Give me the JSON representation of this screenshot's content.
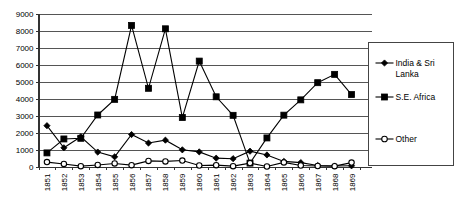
{
  "chart_data": {
    "type": "line",
    "title": "",
    "subtitle": "",
    "xlabel": "",
    "ylabel": "",
    "ylim": [
      0,
      9000
    ],
    "ytick_step": 1000,
    "yticks": [
      "0",
      "1000",
      "2000",
      "3000",
      "4000",
      "5000",
      "6000",
      "7000",
      "8000",
      "9000"
    ],
    "grid": true,
    "legend_position": "right",
    "categories": [
      "1851",
      "1852",
      "1853",
      "1854",
      "1855",
      "1856",
      "1857",
      "1858",
      "1859",
      "1860",
      "1861",
      "1862",
      "1863",
      "1864",
      "1865",
      "1866",
      "1867",
      "1868",
      "1869"
    ],
    "series": [
      {
        "name": "India & Sri Lanka",
        "marker": "diamond",
        "values": [
          2400,
          1100,
          1750,
          850,
          570,
          1880,
          1380,
          1550,
          980,
          860,
          490,
          460,
          900,
          680,
          300,
          230,
          60,
          30,
          40
        ]
      },
      {
        "name": "S.E. Africa",
        "marker": "square",
        "values": [
          800,
          1620,
          1660,
          3030,
          3950,
          8300,
          4600,
          8100,
          2880,
          6200,
          4100,
          3010,
          200,
          1680,
          3020,
          3920,
          4930,
          5420,
          4230
        ]
      },
      {
        "name": "Other",
        "marker": "circle",
        "values": [
          260,
          150,
          20,
          90,
          180,
          80,
          330,
          300,
          350,
          60,
          80,
          20,
          200,
          0,
          240,
          60,
          30,
          20,
          230
        ]
      }
    ]
  },
  "legend": {
    "entries": [
      {
        "label_line1": "India & Sri",
        "label_line2": "Lanka",
        "marker": "diamond-marker"
      },
      {
        "label_line1": "S.E. Africa",
        "label_line2": "",
        "marker": "square-marker"
      },
      {
        "label_line1": "Other",
        "label_line2": "",
        "marker": "circle-marker"
      }
    ]
  }
}
